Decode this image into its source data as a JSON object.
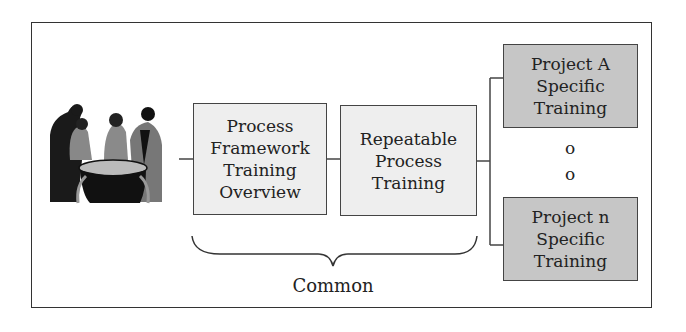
{
  "diagram": {
    "type": "training-structure",
    "nodes": [
      {
        "id": "framework",
        "label": "Process\nFramework\nTraining\nOverview",
        "fill": "#eeeeee"
      },
      {
        "id": "repeatable",
        "label": "Repeatable\nProcess\nTraining",
        "fill": "#eeeeee"
      },
      {
        "id": "projectA",
        "label": "Project A\nSpecific\nTraining",
        "fill": "#c6c6c6"
      },
      {
        "id": "projectN",
        "label": "Project n\nSpecific\nTraining",
        "fill": "#c6c6c6"
      }
    ],
    "ellipsis": [
      "o",
      "o"
    ],
    "brace_label": "Common",
    "image": "people-group-clipart",
    "edges": [
      [
        "image",
        "framework"
      ],
      [
        "framework",
        "repeatable"
      ],
      [
        "repeatable",
        "projectA"
      ],
      [
        "repeatable",
        "projectN"
      ]
    ]
  }
}
